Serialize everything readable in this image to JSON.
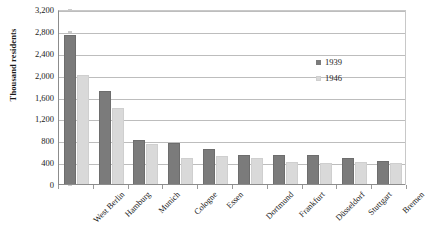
{
  "chart_data": {
    "type": "bar",
    "title": "",
    "xlabel": "",
    "ylabel": "Thousand residents",
    "ylim": [
      0,
      3200
    ],
    "ytick_step": 400,
    "ytick_labels": [
      "3,200",
      "2,800",
      "2,400",
      "2,000",
      "1,600",
      "1,200",
      "800",
      "400",
      "0"
    ],
    "ytick_values": [
      3200,
      2800,
      2400,
      2000,
      1600,
      1200,
      800,
      400,
      0
    ],
    "grid": true,
    "legend_position": "center-right",
    "categories": [
      "West Berlin",
      "Hamburg",
      "Munich",
      "Cologne",
      "Essen",
      "Dortmund",
      "Frankfurt",
      "Düsseldorf",
      "Stuttgart",
      "Bremen"
    ],
    "series": [
      {
        "name": "1939",
        "color": "#7b7b7b",
        "values": [
          2740,
          1710,
          830,
          770,
          665,
          540,
          550,
          540,
          495,
          445
        ]
      },
      {
        "name": "1946",
        "color": "#d9d9d9",
        "values": [
          2010,
          1405,
          750,
          490,
          525,
          500,
          425,
          400,
          415,
          400
        ]
      }
    ]
  },
  "legend": {
    "entries": [
      {
        "label": "1939"
      },
      {
        "label": "1946"
      }
    ]
  },
  "axis": {
    "y_title": "Thousand residents"
  },
  "colors": {
    "series_1939": "#7b7b7b",
    "series_1946": "#d9d9d9",
    "gridline": "#bdbdbd",
    "axis": "#8c8c8c",
    "background": "#ffffff"
  }
}
